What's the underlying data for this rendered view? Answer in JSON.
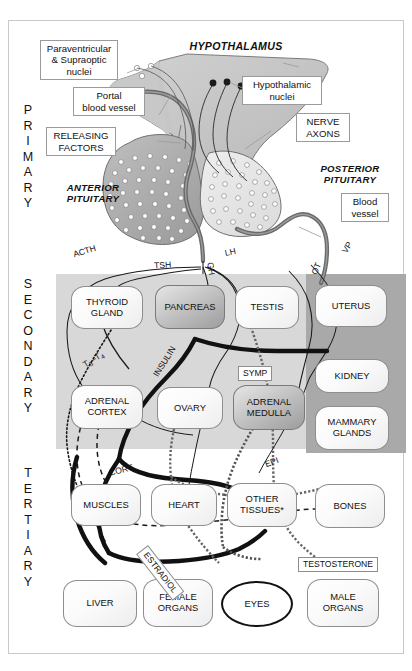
{
  "diagram": {
    "levels": [
      {
        "id": "primary",
        "letters": "PRIMARY"
      },
      {
        "id": "secondary",
        "letters": "SECONDARY"
      },
      {
        "id": "tertiary",
        "letters": "TERTIARY"
      }
    ]
  },
  "primary": {
    "labels": {
      "paraventricular": "Paraventricular\n& Supraoptic\nnuclei",
      "paraventricular_l1": "Paraventricular",
      "paraventricular_l2": "& Supraoptic",
      "paraventricular_l3": "nuclei",
      "portal_l1": "Portal",
      "portal_l2": "blood vessel",
      "releasing_l1": "RELEASING",
      "releasing_l2": "FACTORS",
      "hypothalamus": "HYPOTHALAMUS",
      "hypothalamic_l1": "Hypothalamic",
      "hypothalamic_l2": "nuclei",
      "nerve_l1": "NERVE",
      "nerve_l2": "AXONS",
      "posterior_l1": "POSTERIOR",
      "posterior_l2": "PITUITARY",
      "anterior_l1": "ANTERIOR",
      "anterior_l2": "PITUITARY",
      "blood_l1": "Blood",
      "blood_l2": "vessel"
    }
  },
  "secondary": {
    "hormones": [
      {
        "name": "ACTH",
        "boxed": false
      },
      {
        "name": "TSH",
        "boxed": false
      },
      {
        "name": "GH",
        "boxed": false
      },
      {
        "name": "LH",
        "boxed": false
      },
      {
        "name": "OT",
        "boxed": false
      },
      {
        "name": "VP",
        "boxed": false
      }
    ],
    "organs": [
      {
        "name": "THYROID\nGLAND",
        "l1": "THYROID",
        "l2": "GLAND",
        "shade": "light"
      },
      {
        "name": "PANCREAS",
        "l1": "PANCREAS",
        "l2": "",
        "shade": "dark"
      },
      {
        "name": "TESTIS",
        "l1": "TESTIS",
        "l2": "",
        "shade": "light"
      },
      {
        "name": "UTERUS",
        "l1": "UTERUS",
        "l2": "",
        "shade": "light"
      },
      {
        "name": "ADRENAL\nCORTEX",
        "l1": "ADRENAL",
        "l2": "CORTEX",
        "shade": "light"
      },
      {
        "name": "OVARY",
        "l1": "OVARY",
        "l2": "",
        "shade": "light"
      },
      {
        "name": "ADRENAL\nMEDULLA",
        "l1": "ADRENAL",
        "l2": "MEDULLA",
        "shade": "dark"
      },
      {
        "name": "KIDNEY",
        "l1": "KIDNEY",
        "l2": "",
        "shade": "light"
      },
      {
        "name": "MAMMARY\nGLANDS",
        "l1": "MAMMARY",
        "l2": "GLANDS",
        "shade": "light"
      }
    ],
    "secondary_hormones": [
      {
        "name": "T3-T4",
        "display": "T",
        "s1": "3",
        "mid": "–T",
        "s2": "4",
        "boxed": false
      },
      {
        "name": "INSULIN",
        "display": "INSULIN",
        "boxed": false
      },
      {
        "name": "SYMP",
        "display": "SYMP",
        "boxed": true
      },
      {
        "name": "EPI",
        "display": "EPI",
        "boxed": false
      }
    ]
  },
  "tertiary": {
    "organs": [
      {
        "name": "MUSCLES",
        "l1": "MUSCLES",
        "l2": ""
      },
      {
        "name": "HEART",
        "l1": "HEART",
        "l2": ""
      },
      {
        "name": "OTHER TISSUES*",
        "l1": "OTHER",
        "l2": "TISSUES*"
      },
      {
        "name": "BONES",
        "l1": "BONES",
        "l2": ""
      },
      {
        "name": "LIVER",
        "l1": "LIVER",
        "l2": ""
      },
      {
        "name": "FEMALE ORGANS",
        "l1": "FEMALE",
        "l2": "ORGANS"
      },
      {
        "name": "EYES",
        "l1": "EYES",
        "l2": ""
      },
      {
        "name": "MALE ORGANS",
        "l1": "MALE",
        "l2": "ORGANS"
      }
    ],
    "hormones": [
      {
        "name": "CORT",
        "boxed": false
      },
      {
        "name": "ESTRADIOL",
        "boxed": true
      },
      {
        "name": "TESTOSTERONE",
        "boxed": true
      }
    ]
  },
  "colors": {
    "band_light": "#d8d8d8",
    "band_dark": "#a9a9a9",
    "vessel": "#5a5a5a",
    "outline": "#8e8e8e",
    "text": "#111111"
  }
}
